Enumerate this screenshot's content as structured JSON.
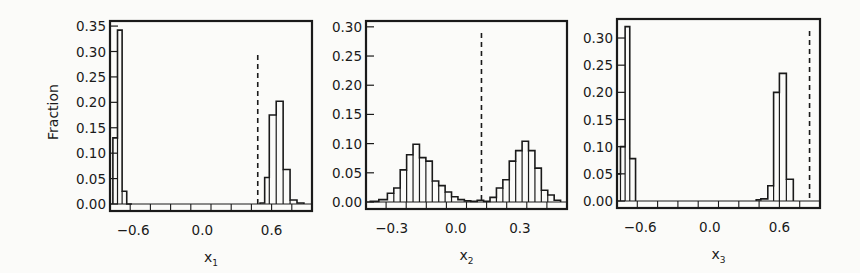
{
  "chart_data": [
    {
      "type": "bar",
      "subtype": "step-histogram",
      "title": "",
      "xlabel": "x1",
      "xlabel_main": "x",
      "xlabel_sub": "1",
      "ylabel": "Fraction",
      "xlim": [
        -0.8,
        0.95
      ],
      "ylim": [
        0,
        0.36
      ],
      "xticks": [
        -0.6,
        0.0,
        0.6
      ],
      "xtick_labels": [
        "−0.6",
        "0.0",
        "0.6"
      ],
      "yticks": [
        0.0,
        0.05,
        0.1,
        0.15,
        0.2,
        0.25,
        0.3,
        0.35
      ],
      "ytick_labels": [
        "0.00",
        "0.05",
        "0.10",
        "0.15",
        "0.20",
        "0.25",
        "0.30",
        "0.35"
      ],
      "threshold_x": 0.48,
      "bin_edges": [
        -0.78,
        -0.72,
        -0.66,
        -0.6,
        -0.54,
        0.48,
        0.54,
        0.6,
        0.66,
        0.72,
        0.78,
        0.84
      ],
      "bins": [
        {
          "x0": -0.775,
          "x1": -0.735,
          "y": 0.13
        },
        {
          "x0": -0.735,
          "x1": -0.695,
          "y": 0.342
        },
        {
          "x0": -0.695,
          "x1": -0.655,
          "y": 0.025
        },
        {
          "x0": -0.655,
          "x1": -0.61,
          "y": 0.0
        },
        {
          "x0": 0.5,
          "x1": 0.54,
          "y": 0.002
        },
        {
          "x0": 0.54,
          "x1": 0.58,
          "y": 0.052
        },
        {
          "x0": 0.58,
          "x1": 0.64,
          "y": 0.175
        },
        {
          "x0": 0.64,
          "x1": 0.7,
          "y": 0.202
        },
        {
          "x0": 0.7,
          "x1": 0.76,
          "y": 0.068
        },
        {
          "x0": 0.76,
          "x1": 0.82,
          "y": 0.008
        },
        {
          "x0": 0.82,
          "x1": 0.88,
          "y": 0.002
        }
      ],
      "grid": false,
      "legend": null
    },
    {
      "type": "bar",
      "subtype": "step-histogram",
      "title": "",
      "xlabel": "x2",
      "xlabel_main": "x",
      "xlabel_sub": "2",
      "ylabel": "",
      "xlim": [
        -0.42,
        0.52
      ],
      "ylim": [
        0,
        0.31
      ],
      "xticks": [
        -0.3,
        0.0,
        0.3
      ],
      "xtick_labels": [
        "−0.3",
        "0.0",
        "0.3"
      ],
      "yticks": [
        0.0,
        0.05,
        0.1,
        0.15,
        0.2,
        0.25,
        0.3
      ],
      "ytick_labels": [
        "0.00",
        "0.05",
        "0.10",
        "0.15",
        "0.20",
        "0.25",
        "0.30"
      ],
      "threshold_x": 0.12,
      "bins": [
        {
          "x0": -0.4,
          "x1": -0.36,
          "y": 0.001
        },
        {
          "x0": -0.36,
          "x1": -0.32,
          "y": 0.004
        },
        {
          "x0": -0.32,
          "x1": -0.29,
          "y": 0.015
        },
        {
          "x0": -0.29,
          "x1": -0.26,
          "y": 0.024
        },
        {
          "x0": -0.26,
          "x1": -0.23,
          "y": 0.055
        },
        {
          "x0": -0.23,
          "x1": -0.2,
          "y": 0.081
        },
        {
          "x0": -0.2,
          "x1": -0.17,
          "y": 0.099
        },
        {
          "x0": -0.17,
          "x1": -0.14,
          "y": 0.076
        },
        {
          "x0": -0.14,
          "x1": -0.11,
          "y": 0.07
        },
        {
          "x0": -0.11,
          "x1": -0.08,
          "y": 0.036
        },
        {
          "x0": -0.08,
          "x1": -0.05,
          "y": 0.028
        },
        {
          "x0": -0.05,
          "x1": -0.02,
          "y": 0.017
        },
        {
          "x0": -0.02,
          "x1": 0.01,
          "y": 0.009
        },
        {
          "x0": 0.01,
          "x1": 0.04,
          "y": 0.004
        },
        {
          "x0": 0.04,
          "x1": 0.07,
          "y": 0.002
        },
        {
          "x0": 0.07,
          "x1": 0.1,
          "y": 0.001
        },
        {
          "x0": 0.1,
          "x1": 0.13,
          "y": 0.003
        },
        {
          "x0": 0.13,
          "x1": 0.16,
          "y": 0.001
        },
        {
          "x0": 0.16,
          "x1": 0.19,
          "y": 0.008
        },
        {
          "x0": 0.19,
          "x1": 0.22,
          "y": 0.024
        },
        {
          "x0": 0.22,
          "x1": 0.25,
          "y": 0.038
        },
        {
          "x0": 0.25,
          "x1": 0.28,
          "y": 0.07
        },
        {
          "x0": 0.28,
          "x1": 0.31,
          "y": 0.088
        },
        {
          "x0": 0.31,
          "x1": 0.34,
          "y": 0.104
        },
        {
          "x0": 0.34,
          "x1": 0.37,
          "y": 0.088
        },
        {
          "x0": 0.37,
          "x1": 0.4,
          "y": 0.058
        },
        {
          "x0": 0.4,
          "x1": 0.43,
          "y": 0.02
        },
        {
          "x0": 0.43,
          "x1": 0.46,
          "y": 0.012
        },
        {
          "x0": 0.46,
          "x1": 0.49,
          "y": 0.003
        }
      ],
      "grid": false,
      "legend": null
    },
    {
      "type": "bar",
      "subtype": "step-histogram",
      "title": "",
      "xlabel": "x3",
      "xlabel_main": "x",
      "xlabel_sub": "3",
      "ylabel": "",
      "xlim": [
        -0.8,
        0.95
      ],
      "ylim": [
        0,
        0.335
      ],
      "xticks": [
        -0.6,
        0.0,
        0.6
      ],
      "xtick_labels": [
        "−0.6",
        "0.0",
        "0.6"
      ],
      "yticks": [
        0.0,
        0.05,
        0.1,
        0.15,
        0.2,
        0.25,
        0.3
      ],
      "ytick_labels": [
        "0.00",
        "0.05",
        "0.10",
        "0.15",
        "0.20",
        "0.25",
        "0.30"
      ],
      "threshold_x": 0.86,
      "bins": [
        {
          "x0": -0.8,
          "x1": -0.77,
          "y": 0.05
        },
        {
          "x0": -0.77,
          "x1": -0.73,
          "y": 0.1
        },
        {
          "x0": -0.73,
          "x1": -0.69,
          "y": 0.321
        },
        {
          "x0": -0.69,
          "x1": -0.64,
          "y": 0.078
        },
        {
          "x0": 0.4,
          "x1": 0.44,
          "y": 0.002
        },
        {
          "x0": 0.44,
          "x1": 0.5,
          "y": 0.004
        },
        {
          "x0": 0.5,
          "x1": 0.55,
          "y": 0.028
        },
        {
          "x0": 0.55,
          "x1": 0.6,
          "y": 0.2
        },
        {
          "x0": 0.6,
          "x1": 0.66,
          "y": 0.235
        },
        {
          "x0": 0.66,
          "x1": 0.72,
          "y": 0.04
        }
      ],
      "grid": false,
      "legend": null
    }
  ],
  "panels": [
    {
      "frame": {
        "x": 110,
        "y": 21,
        "w": 202,
        "h": 190
      }
    },
    {
      "frame": {
        "x": 366,
        "y": 21,
        "w": 201,
        "h": 188
      }
    },
    {
      "frame": {
        "x": 617,
        "y": 19,
        "w": 203,
        "h": 189
      }
    }
  ],
  "style": {
    "ink": "#1a1a1a",
    "background": "#fbfbf9"
  }
}
